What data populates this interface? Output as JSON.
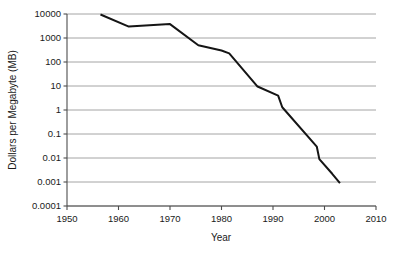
{
  "chart_data": {
    "type": "line",
    "title": "",
    "subtitle": "",
    "xlabel": "Year",
    "ylabel": "Dollars per Megabyte (MB)",
    "xlim": [
      1950,
      2010
    ],
    "ylim": [
      0.0001,
      10000
    ],
    "yscale": "log",
    "xscale": "linear",
    "grid": "horizontal",
    "legend": "none",
    "xticks": [
      1950,
      1960,
      1970,
      1980,
      1990,
      2000,
      2010
    ],
    "xtick_labels": [
      "1950",
      "1960",
      "1970",
      "1980",
      "1990",
      "2000",
      "2010"
    ],
    "yticks": [
      10000,
      1000,
      100,
      10,
      1,
      0.1,
      0.01,
      0.001,
      0.0001
    ],
    "ytick_labels": [
      "10000",
      "1000",
      "100",
      "10",
      "1",
      "0.1",
      "0.01",
      "0.001",
      "0.0001"
    ],
    "series": [
      {
        "name": "Dollars per Megabyte",
        "color": "#151515",
        "x": [
          1956.5,
          1962.0,
          1970.0,
          1975.5,
          1980.0,
          1981.5,
          1987.0,
          1991.0,
          1991.8,
          1998.5,
          1999.0,
          2001.5,
          2003.0
        ],
        "y": [
          9500,
          3000,
          3800,
          500,
          300,
          230,
          9.5,
          4.0,
          1.3,
          0.03,
          0.009,
          0.0022,
          0.0009
        ],
        "points": [
          {
            "year": 1956.5,
            "value": 9500
          },
          {
            "year": 1962.0,
            "value": 3000
          },
          {
            "year": 1970.0,
            "value": 3800
          },
          {
            "year": 1975.5,
            "value": 500
          },
          {
            "year": 1980.0,
            "value": 300
          },
          {
            "year": 1981.5,
            "value": 230
          },
          {
            "year": 1987.0,
            "value": 9.5
          },
          {
            "year": 1991.0,
            "value": 4.0
          },
          {
            "year": 1991.8,
            "value": 1.3
          },
          {
            "year": 1998.5,
            "value": 0.03
          },
          {
            "year": 1999.0,
            "value": 0.009
          },
          {
            "year": 2001.5,
            "value": 0.0022
          },
          {
            "year": 2003.0,
            "value": 0.0009
          }
        ]
      }
    ]
  },
  "colors": {
    "line": "#151515",
    "grid": "#9a9a9a",
    "axis": "#4d4d4d",
    "background": "#ffffff",
    "text": "#1a1a1a"
  },
  "geometry": {
    "plot_left": 67,
    "plot_right": 376,
    "plot_top": 14,
    "plot_bottom": 206
  }
}
